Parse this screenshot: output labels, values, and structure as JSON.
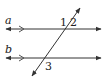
{
  "diagram": {
    "type": "parallel-lines-transversal",
    "lines": [
      {
        "name": "a",
        "label": "a"
      },
      {
        "name": "b",
        "label": "b"
      }
    ],
    "angles": [
      {
        "id": "1",
        "label": "1"
      },
      {
        "id": "2",
        "label": "2"
      },
      {
        "id": "3",
        "label": "3"
      }
    ],
    "colors": {
      "stroke": "#333333",
      "background": "#ffffff"
    }
  }
}
